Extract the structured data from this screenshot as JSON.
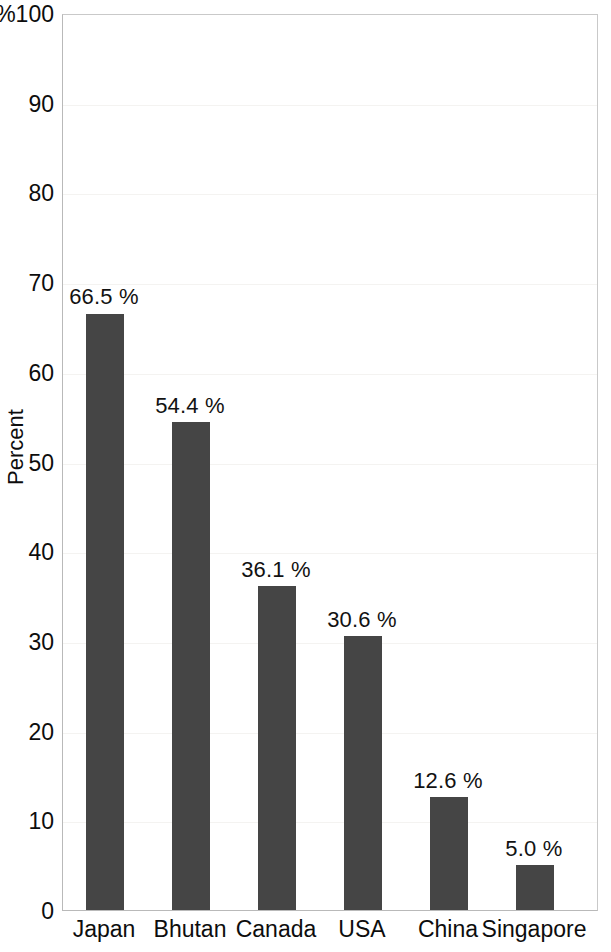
{
  "chart_data": {
    "type": "bar",
    "title": "",
    "subtitle": "",
    "xlabel": "",
    "ylabel": "Percent",
    "y_axis_unit_prefix": "%",
    "categories": [
      "Japan",
      "Bhutan",
      "Canada",
      "USA",
      "China",
      "Singapore"
    ],
    "values": [
      66.5,
      54.4,
      36.1,
      30.6,
      12.6,
      5.0
    ],
    "data_labels": [
      "66.5 %",
      "54.4 %",
      "36.1 %",
      "30.6 %",
      "12.6 %",
      "5.0 %"
    ],
    "ylim": [
      0,
      100
    ],
    "ytick_values": [
      0,
      10,
      20,
      30,
      40,
      50,
      60,
      70,
      80,
      90,
      100
    ],
    "ytick_labels": [
      "0",
      "10",
      "20",
      "30",
      "40",
      "50",
      "60",
      "70",
      "80",
      "90",
      "%100"
    ],
    "grid": true,
    "legend": false,
    "legend_position": "none",
    "bar_color": "#454545",
    "background_color": "#ffffff",
    "axis_color": "#b9b9b9",
    "text_color": "#0d0d0d"
  }
}
